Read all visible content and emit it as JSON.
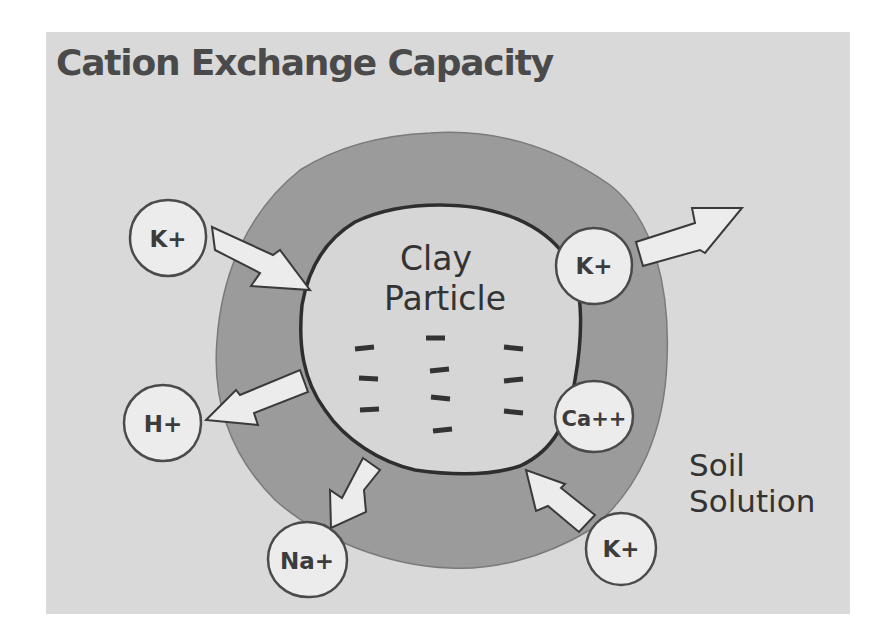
{
  "title": "Cation Exchange Capacity",
  "clay_label": {
    "line1": "Clay",
    "line2": "Particle"
  },
  "soil_label": {
    "line1": "Soil",
    "line2": "Solution"
  },
  "ions": [
    {
      "id": "k-top-left",
      "label": "K+",
      "direction": "in"
    },
    {
      "id": "k-top-right",
      "label": "K+",
      "direction": "out"
    },
    {
      "id": "h",
      "label": "H+",
      "direction": "out"
    },
    {
      "id": "ca",
      "label": "Ca++",
      "direction": "adsorbed"
    },
    {
      "id": "na",
      "label": "Na+",
      "direction": "out"
    },
    {
      "id": "k-bottom-right",
      "label": "K+",
      "direction": "in"
    }
  ],
  "negative_charge_symbol": "–",
  "negative_charge_count": 10,
  "colors": {
    "background": "#d9d9d9",
    "exchange_zone": "#9b9b9b",
    "clay": "#d6d6d6",
    "ion": "#ececec",
    "outline": "#3a3a3a",
    "text": "#3c3c3c"
  }
}
